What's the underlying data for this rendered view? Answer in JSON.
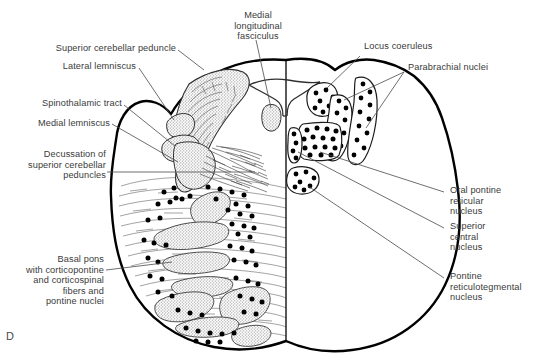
{
  "figure": {
    "panel_letter": "D",
    "style": {
      "outline_color": "#000000",
      "fiber_line_color": "#3a3a3a",
      "stipple_fill": "#c9c9c9",
      "nucleus_dot_color": "#000000",
      "label_color": "#3a3a3a",
      "background": "#ffffff"
    }
  },
  "labels": {
    "superior_cerebellar_peduncle": "Superior cerebellar peduncle",
    "lateral_lemniscus": "Lateral lemniscus",
    "spinothalamic_tract": "Spinothalamic tract",
    "medial_lemniscus": "Medial lemniscus",
    "decussation": "Decussation of\nsuperior cerebellar\npeduncles",
    "basal_pons": "Basal pons\nwith corticopontine\nand corticospinal\nfibers and\npontine nuclei",
    "medial_longitudinal_fasciculus": "Medial\nlongitudinal\nfasciculus",
    "locus_coeruleus": "Locus coeruleus",
    "parabrachial_nuclei": "Parabrachial nuclei",
    "oral_pontine_reticular_nucleus": "Oral pontine\nreticular\nnucleus",
    "superior_central_nucleus": "Superior\ncentral\nnucleus",
    "pontine_reticulotegmental_nucleus": "Pontine\nreticulotegmental\nnucleus"
  },
  "structures": [
    {
      "id": "superior-cerebellar-peduncle",
      "label": "Superior cerebellar peduncle",
      "side": "left",
      "fill": "stipple"
    },
    {
      "id": "lateral-lemniscus",
      "label": "Lateral lemniscus",
      "side": "left",
      "fill": "stipple"
    },
    {
      "id": "spinothalamic-tract",
      "label": "Spinothalamic tract",
      "side": "left",
      "fill": "stipple"
    },
    {
      "id": "medial-lemniscus",
      "label": "Medial lemniscus",
      "side": "left",
      "fill": "stipple"
    },
    {
      "id": "decussation-superior-cerebellar-peduncles",
      "label": "Decussation of superior cerebellar peduncles",
      "side": "left",
      "fill": "fibers"
    },
    {
      "id": "basal-pons",
      "label": "Basal pons with corticopontine and corticospinal fibers and pontine nuclei",
      "side": "left",
      "fill": "fibers-and-dots"
    },
    {
      "id": "medial-longitudinal-fasciculus",
      "label": "Medial longitudinal fasciculus",
      "side": "midline",
      "fill": "stipple"
    },
    {
      "id": "locus-coeruleus",
      "label": "Locus coeruleus",
      "side": "right",
      "fill": "dots"
    },
    {
      "id": "parabrachial-nuclei",
      "label": "Parabrachial nuclei",
      "side": "right",
      "fill": "dots",
      "count": 2
    },
    {
      "id": "oral-pontine-reticular-nucleus",
      "label": "Oral pontine reticular nucleus",
      "side": "right",
      "fill": "dots"
    },
    {
      "id": "superior-central-nucleus",
      "label": "Superior central nucleus",
      "side": "right",
      "fill": "dots"
    },
    {
      "id": "pontine-reticulotegmental-nucleus",
      "label": "Pontine reticulotegmental nucleus",
      "side": "right",
      "fill": "dots"
    }
  ]
}
